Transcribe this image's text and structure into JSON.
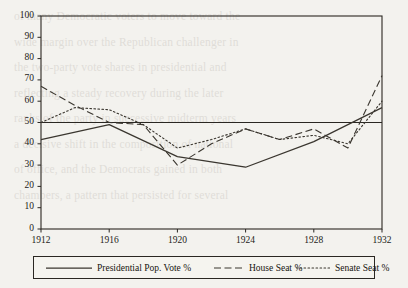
{
  "figure": {
    "background_color": "#f3f2ee",
    "axis_color": "#2a2722",
    "series_color": "#3a362f",
    "plot_area": {
      "left": 41,
      "top": 16,
      "right": 382,
      "bottom": 229
    }
  },
  "legend": {
    "position": "below-axes",
    "entries": [
      {
        "label": "Presidential Pop. Vote %",
        "style": "solid"
      },
      {
        "label": "House Seat %",
        "style": "dashed"
      },
      {
        "label": "Senate Seat %",
        "style": "dotted"
      }
    ]
  },
  "chart_data": {
    "type": "line",
    "title": "",
    "subtitle": "",
    "xlabel": "",
    "ylabel": "",
    "xlim": [
      1912,
      1932
    ],
    "ylim": [
      0,
      100
    ],
    "grid": false,
    "legend_position": "below",
    "xticks": [
      1912,
      1916,
      1920,
      1924,
      1928,
      1932
    ],
    "xtick_labels": [
      "1912",
      "1916",
      "1920",
      "1924",
      "1928",
      "1932"
    ],
    "yticks": [
      0,
      10,
      20,
      30,
      40,
      50,
      60,
      70,
      80,
      90,
      100
    ],
    "ytick_labels": [
      "0",
      "10",
      "20",
      "30",
      "40",
      "50",
      "60",
      "70",
      "80",
      "90",
      "100"
    ],
    "reference_lines": [
      {
        "axis": "y",
        "value": 50,
        "style": "solid",
        "label": ""
      }
    ],
    "series": [
      {
        "name": "Presidential Pop. Vote %",
        "style": "solid",
        "x": [
          1912,
          1916,
          1920,
          1924,
          1928,
          1932
        ],
        "values": [
          42,
          49,
          34,
          29,
          41,
          57
        ]
      },
      {
        "name": "House Seat %",
        "style": "dashed",
        "x": [
          1912,
          1914,
          1916,
          1918,
          1920,
          1922,
          1924,
          1926,
          1928,
          1930,
          1932
        ],
        "values": [
          67,
          58,
          50,
          49,
          30,
          40,
          47,
          42,
          47,
          38,
          72
        ]
      },
      {
        "name": "Senate Seat %",
        "style": "dotted",
        "x": [
          1912,
          1914,
          1916,
          1918,
          1920,
          1922,
          1924,
          1926,
          1928,
          1930,
          1932
        ],
        "values": [
          50,
          57,
          56,
          49,
          38,
          42,
          47,
          42,
          44,
          40,
          60
        ]
      }
    ]
  },
  "page_bleed": {
    "lines": [
      "",
      "of many Democratic voters to move toward the",
      "wide margin over the Republican challenger in",
      "",
      "the two-party vote shares in presidential and",
      "reflecting a steady recovery during the later",
      "",
      "ranks of the party in successive midterm years",
      "",
      "a decisive shift in the composition of national",
      "of office, and the Democrats gained in both",
      "chambers, a pattern that persisted for several"
    ]
  }
}
